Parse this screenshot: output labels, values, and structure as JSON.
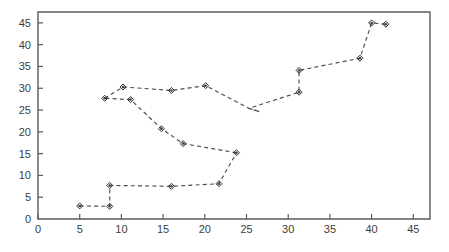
{
  "chart_data": {
    "type": "line",
    "title": "",
    "subtitle": "",
    "xlabel": "",
    "ylabel": "",
    "xlim": [
      0,
      47
    ],
    "ylim": [
      0,
      47.5
    ],
    "xticks": [
      0,
      5,
      10,
      15,
      20,
      25,
      30,
      35,
      40,
      45
    ],
    "yticks": [
      0,
      5,
      10,
      15,
      20,
      25,
      30,
      35,
      40,
      45
    ],
    "xtick_labels": [
      "0",
      "5",
      "10",
      "15",
      "20",
      "25",
      "30",
      "35",
      "40",
      "45"
    ],
    "ytick_labels": [
      "0",
      "5",
      "10",
      "15",
      "20",
      "25",
      "30",
      "35",
      "40",
      "45"
    ],
    "grid": false,
    "legend": null,
    "legend_position": "none",
    "marker": "diamond-dot",
    "line_style": "dashed",
    "line_color": "#4a4a52",
    "marker_color": "#2e2e34",
    "axis_color": "#5a5a5a",
    "background_color": "#ffffff",
    "series": [
      {
        "name": "lower-branch",
        "points": [
          [
            5.0,
            3.0
          ],
          [
            8.6,
            2.9
          ],
          [
            8.6,
            7.7
          ],
          [
            16.0,
            7.5
          ],
          [
            21.7,
            8.1
          ],
          [
            23.8,
            15.2
          ]
        ]
      },
      {
        "name": "descending-branch",
        "points": [
          [
            23.8,
            15.2
          ],
          [
            17.4,
            17.3
          ],
          [
            14.8,
            20.7
          ],
          [
            11.1,
            27.4
          ],
          [
            8.0,
            27.7
          ]
        ]
      },
      {
        "name": "upper-branch",
        "points": [
          [
            8.0,
            27.7
          ],
          [
            10.2,
            30.3
          ],
          [
            16.0,
            29.5
          ],
          [
            20.1,
            30.6
          ],
          [
            25.4,
            25.3
          ],
          [
            26.6,
            24.6
          ],
          [
            25.3,
            25.4
          ],
          [
            31.3,
            29.1
          ],
          [
            31.3,
            34.1
          ],
          [
            38.6,
            36.9
          ],
          [
            40.0,
            45.0
          ],
          [
            41.7,
            44.7
          ]
        ]
      }
    ],
    "markers": [
      [
        5.0,
        3.0
      ],
      [
        8.6,
        2.9
      ],
      [
        8.6,
        7.7
      ],
      [
        16.0,
        7.5
      ],
      [
        21.7,
        8.1
      ],
      [
        23.8,
        15.2
      ],
      [
        17.4,
        17.3
      ],
      [
        14.8,
        20.7
      ],
      [
        11.1,
        27.4
      ],
      [
        8.0,
        27.7
      ],
      [
        10.2,
        30.3
      ],
      [
        16.0,
        29.5
      ],
      [
        20.1,
        30.6
      ],
      [
        31.3,
        29.1
      ],
      [
        31.3,
        34.1
      ],
      [
        38.6,
        36.9
      ],
      [
        40.0,
        45.0
      ],
      [
        41.7,
        44.7
      ]
    ]
  },
  "axes": {
    "x_axis_name": "x-axis",
    "y_axis_name": "y-axis"
  }
}
